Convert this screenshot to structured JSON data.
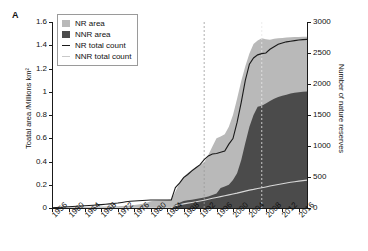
{
  "panel": {
    "label": "A"
  },
  "colors": {
    "nr_area": "#b9b9b9",
    "nnr_area": "#4b4b4b",
    "nr_line": "#1a1a1a",
    "nnr_line": "#d8d8d8",
    "axis": "#1a1a1a",
    "marker_1993": "#9a9a9a",
    "marker_2007": "#e8e8e8"
  },
  "legend": {
    "items": [
      {
        "label": "NR area",
        "type": "swatch",
        "color": "#b9b9b9"
      },
      {
        "label": "NNR area",
        "type": "swatch",
        "color": "#4b4b4b"
      },
      {
        "label": "NR total count",
        "type": "line",
        "color": "#1a1a1a"
      },
      {
        "label": "NNR total count",
        "type": "line",
        "color": "#c9c9c9"
      }
    ]
  },
  "chart_data": {
    "type": "area",
    "title": "",
    "subtitle": "",
    "xlabel": "",
    "ylabel": "Toatal area /Millions km²",
    "y2label": "Number of nature reserves",
    "grid": false,
    "legend_position": "top-left",
    "xlim": [
      1956,
      2018
    ],
    "ylim": [
      0,
      1.6
    ],
    "y2lim": [
      0,
      3000
    ],
    "xticks": [
      1956,
      1960,
      1964,
      1968,
      1972,
      1976,
      1980,
      1984,
      1988,
      1992,
      1996,
      2000,
      2004,
      2008,
      2012,
      2016
    ],
    "yticks": [
      0,
      0.2,
      0.4,
      0.6,
      0.8,
      1,
      1.2,
      1.4,
      1.6
    ],
    "y2ticks": [
      0,
      500,
      1000,
      1500,
      2000,
      2500,
      3000
    ],
    "annotations": [
      {
        "name": "vline-1993",
        "x": 1993,
        "style": "dashed",
        "color": "#9a9a9a"
      },
      {
        "name": "vline-2007",
        "x": 2007,
        "style": "dashed",
        "color": "#e8e8e8"
      }
    ],
    "x": [
      1956,
      1957,
      1958,
      1959,
      1960,
      1961,
      1962,
      1963,
      1964,
      1965,
      1966,
      1967,
      1968,
      1969,
      1970,
      1971,
      1972,
      1973,
      1974,
      1975,
      1976,
      1977,
      1978,
      1979,
      1980,
      1981,
      1982,
      1983,
      1984,
      1985,
      1986,
      1987,
      1988,
      1989,
      1990,
      1991,
      1992,
      1993,
      1994,
      1995,
      1996,
      1997,
      1998,
      1999,
      2000,
      2001,
      2002,
      2003,
      2004,
      2005,
      2006,
      2007,
      2008,
      2009,
      2010,
      2011,
      2012,
      2013,
      2014,
      2015,
      2016,
      2017,
      2018
    ],
    "series": [
      {
        "name": "NR area",
        "axis": "left",
        "units": "Millions km²",
        "kind": "stacked-area-total",
        "values": [
          0.002,
          0.002,
          0.003,
          0.004,
          0.005,
          0.006,
          0.007,
          0.008,
          0.009,
          0.01,
          0.011,
          0.012,
          0.013,
          0.013,
          0.014,
          0.015,
          0.016,
          0.018,
          0.02,
          0.022,
          0.026,
          0.03,
          0.036,
          0.045,
          0.058,
          0.062,
          0.064,
          0.066,
          0.068,
          0.074,
          0.14,
          0.215,
          0.268,
          0.3,
          0.33,
          0.352,
          0.372,
          0.392,
          0.455,
          0.53,
          0.6,
          0.616,
          0.634,
          0.7,
          0.8,
          0.94,
          1.09,
          1.22,
          1.33,
          1.41,
          1.44,
          1.46,
          1.452,
          1.448,
          1.455,
          1.46,
          1.463,
          1.466,
          1.468,
          1.47,
          1.472,
          1.473,
          1.474
        ]
      },
      {
        "name": "NNR area",
        "axis": "left",
        "units": "Millions km²",
        "kind": "stacked-area-bottom",
        "values": [
          0.0,
          0.0,
          0.0,
          0.0,
          0.0,
          0.0,
          0.0,
          0.0,
          0.0,
          0.0,
          0.0,
          0.0,
          0.0,
          0.0,
          0.0,
          0.0,
          0.0,
          0.0,
          0.0,
          0.0,
          0.0,
          0.0,
          0.0,
          0.0,
          0.0,
          0.0,
          0.0,
          0.0,
          0.0,
          0.002,
          0.032,
          0.046,
          0.06,
          0.066,
          0.072,
          0.078,
          0.084,
          0.09,
          0.1,
          0.112,
          0.124,
          0.172,
          0.186,
          0.2,
          0.24,
          0.3,
          0.41,
          0.56,
          0.7,
          0.8,
          0.87,
          0.88,
          0.9,
          0.92,
          0.94,
          0.955,
          0.965,
          0.975,
          0.985,
          0.992,
          0.996,
          1.0,
          1.002
        ]
      },
      {
        "name": "NR total count",
        "axis": "right",
        "units": "reserves",
        "kind": "line",
        "values": [
          5,
          8,
          12,
          16,
          20,
          24,
          28,
          32,
          36,
          40,
          45,
          50,
          55,
          60,
          66,
          72,
          80,
          90,
          100,
          108,
          112,
          116,
          120,
          124,
          128,
          128,
          128,
          128,
          128,
          130,
          330,
          400,
          490,
          540,
          600,
          650,
          700,
          780,
          840,
          870,
          880,
          900,
          920,
          1030,
          1120,
          1380,
          1700,
          2060,
          2320,
          2420,
          2470,
          2490,
          2500,
          2560,
          2600,
          2640,
          2660,
          2680,
          2690,
          2700,
          2710,
          2715,
          2720
        ]
      },
      {
        "name": "NNR total count",
        "axis": "right",
        "units": "reserves",
        "kind": "line",
        "values": [
          0,
          0,
          0,
          0,
          0,
          0,
          0,
          0,
          0,
          0,
          0,
          0,
          0,
          0,
          0,
          0,
          0,
          0,
          0,
          0,
          0,
          0,
          0,
          0,
          0,
          0,
          0,
          0,
          0,
          4,
          38,
          52,
          66,
          78,
          90,
          100,
          112,
          124,
          140,
          156,
          170,
          184,
          198,
          212,
          226,
          240,
          256,
          272,
          288,
          300,
          314,
          326,
          340,
          354,
          366,
          378,
          390,
          402,
          414,
          424,
          434,
          442,
          450
        ]
      }
    ]
  }
}
